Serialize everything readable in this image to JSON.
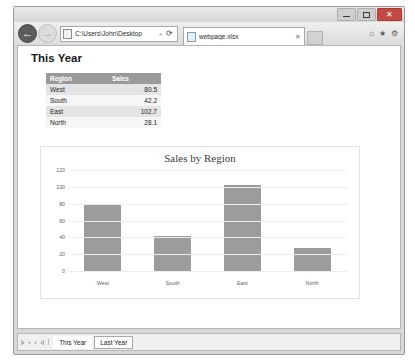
{
  "window": {
    "minimize_label": "",
    "maximize_label": "",
    "close_label": "✕"
  },
  "navigation": {
    "back_icon": "←",
    "forward_icon": "→",
    "home_icon": "⌂",
    "favorites_icon": "★",
    "settings_icon": "⚙",
    "address_value": "C:\\Users\\John\\Desktop",
    "address_search_icon": "⌕",
    "address_refresh_icon": "⟳",
    "new_tab_label": ""
  },
  "tab": {
    "title": "webpage.xlsx",
    "close_icon": "✕"
  },
  "page": {
    "heading": "This Year"
  },
  "table": {
    "headers": [
      "Region",
      "Sales"
    ],
    "rows": [
      {
        "region": "West",
        "sales": "80.5"
      },
      {
        "region": "South",
        "sales": "42.2"
      },
      {
        "region": "East",
        "sales": "102.7"
      },
      {
        "region": "North",
        "sales": "28.1"
      }
    ]
  },
  "chart_data": {
    "type": "bar",
    "title": "Sales by Region",
    "xlabel": "",
    "ylabel": "",
    "categories": [
      "West",
      "South",
      "East",
      "North"
    ],
    "values": [
      80.5,
      42.2,
      102.7,
      28.1
    ],
    "yticks": [
      0,
      20,
      40,
      60,
      80,
      100,
      120
    ],
    "ylim": [
      0,
      120
    ],
    "grid": true,
    "legend": "none",
    "bar_color": "#9c9c9c"
  },
  "sheetbar": {
    "nav_first": "|‹",
    "nav_prev": "‹",
    "nav_next": "›",
    "nav_last": "›|",
    "tabs": [
      {
        "label": "This Year",
        "active": true
      },
      {
        "label": "Last Year",
        "active": false
      }
    ]
  }
}
